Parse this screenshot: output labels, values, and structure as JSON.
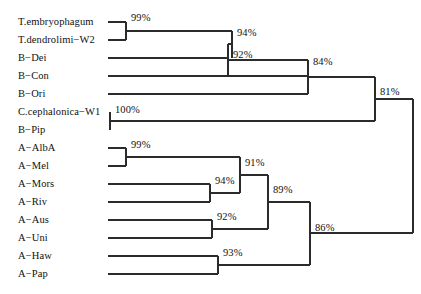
{
  "figure": {
    "type": "phylogenetic-tree",
    "title": "",
    "width": 421,
    "height": 294,
    "line_color": "#2b2b2b",
    "text_color": "#111111",
    "background": "#ffffff"
  },
  "taxa": [
    {
      "label": "T.embryophagum",
      "row": 0,
      "y": 22,
      "tip_x": 108
    },
    {
      "label": "T.dendrolimi−W2",
      "row": 1,
      "y": 40,
      "tip_x": 108
    },
    {
      "label": "B−Dei",
      "row": 2,
      "y": 58,
      "tip_x": 108
    },
    {
      "label": "B−Con",
      "row": 3,
      "y": 76,
      "tip_x": 108
    },
    {
      "label": "B−Ori",
      "row": 4,
      "y": 94,
      "tip_x": 108
    },
    {
      "label": "C.cephalonica−W1",
      "row": 5,
      "y": 112,
      "tip_x": 110
    },
    {
      "label": "B−Pip",
      "row": 6,
      "y": 130,
      "tip_x": 110
    },
    {
      "label": "A−AlbA",
      "row": 7,
      "y": 148,
      "tip_x": 108
    },
    {
      "label": "A−Mel",
      "row": 8,
      "y": 166,
      "tip_x": 108
    },
    {
      "label": "A−Mors",
      "row": 9,
      "y": 184,
      "tip_x": 108
    },
    {
      "label": "A−Riv",
      "row": 10,
      "y": 202,
      "tip_x": 108
    },
    {
      "label": "A−Aus",
      "row": 11,
      "y": 220,
      "tip_x": 108
    },
    {
      "label": "A−Uni",
      "row": 12,
      "y": 238,
      "tip_x": 108
    },
    {
      "label": "A−Haw",
      "row": 13,
      "y": 256,
      "tip_x": 108
    },
    {
      "label": "A−Pap",
      "row": 14,
      "y": 274,
      "tip_x": 108
    }
  ],
  "label_x": 18,
  "nodes": [
    {
      "id": "n99a",
      "support": "99%",
      "x": 126,
      "y_top": 22,
      "y_bottom": 40,
      "y_mid": 31,
      "label_x": 131,
      "label_y": 18
    },
    {
      "id": "n94a",
      "support": "94%",
      "x": 232,
      "y_top": 31,
      "y_bottom": 58,
      "y_mid": 44,
      "label_x": 237,
      "label_y": 33
    },
    {
      "id": "n92a",
      "support": "92%",
      "x": 228,
      "y_top": 44,
      "y_bottom": 76,
      "y_mid": 60,
      "label_x": 233,
      "label_y": 55
    },
    {
      "id": "n84",
      "support": "84%",
      "x": 308,
      "y_top": 60,
      "y_bottom": 94,
      "y_mid": 77,
      "label_x": 313,
      "label_y": 62
    },
    {
      "id": "n100",
      "support": "100%",
      "x": 110,
      "y_top": 112,
      "y_bottom": 130,
      "y_mid": 121,
      "label_x": 115,
      "label_y": 110
    },
    {
      "id": "n81",
      "support": "81%",
      "x": 375,
      "y_top": 77,
      "y_bottom": 121,
      "y_mid": 99,
      "label_x": 380,
      "label_y": 92
    },
    {
      "id": "n99b",
      "support": "99%",
      "x": 126,
      "y_top": 148,
      "y_bottom": 166,
      "y_mid": 157,
      "label_x": 131,
      "label_y": 145
    },
    {
      "id": "n94b",
      "support": "94%",
      "x": 210,
      "y_top": 184,
      "y_bottom": 202,
      "y_mid": 193,
      "label_x": 215,
      "label_y": 181
    },
    {
      "id": "n91",
      "support": "91%",
      "x": 240,
      "y_top": 157,
      "y_bottom": 193,
      "y_mid": 175,
      "label_x": 245,
      "label_y": 163
    },
    {
      "id": "n92b",
      "support": "92%",
      "x": 212,
      "y_top": 220,
      "y_bottom": 238,
      "y_mid": 229,
      "label_x": 217,
      "label_y": 217
    },
    {
      "id": "n89",
      "support": "89%",
      "x": 268,
      "y_top": 175,
      "y_bottom": 229,
      "y_mid": 202,
      "label_x": 273,
      "label_y": 190
    },
    {
      "id": "n93",
      "support": "93%",
      "x": 218,
      "y_top": 256,
      "y_bottom": 274,
      "y_mid": 265,
      "label_x": 223,
      "label_y": 253
    },
    {
      "id": "n86",
      "support": "86%",
      "x": 310,
      "y_top": 202,
      "y_bottom": 265,
      "y_mid": 233,
      "label_x": 315,
      "label_y": 228
    },
    {
      "id": "root",
      "support": "",
      "x": 413,
      "y_top": 99,
      "y_bottom": 233,
      "y_mid": 166,
      "label_x": 0,
      "label_y": 0
    }
  ],
  "edges": [
    {
      "name": "tip-T-embryophagum",
      "x1": 108,
      "y1": 22,
      "x2": 126,
      "y2": 22
    },
    {
      "name": "tip-T-dendrolimi-W2",
      "x1": 108,
      "y1": 40,
      "x2": 126,
      "y2": 40
    },
    {
      "name": "tip-B-Dei",
      "x1": 108,
      "y1": 58,
      "x2": 228,
      "y2": 58
    },
    {
      "name": "tip-B-Con",
      "x1": 108,
      "y1": 76,
      "x2": 308,
      "y2": 76
    },
    {
      "name": "tip-B-Ori",
      "x1": 108,
      "y1": 94,
      "x2": 308,
      "y2": 94
    },
    {
      "name": "tip-C-cephalonica-W1",
      "x1": 110,
      "y1": 112,
      "x2": 110,
      "y2": 112
    },
    {
      "name": "tip-B-Pip",
      "x1": 110,
      "y1": 130,
      "x2": 110,
      "y2": 130
    },
    {
      "name": "tip-A-AlbA",
      "x1": 108,
      "y1": 148,
      "x2": 126,
      "y2": 148
    },
    {
      "name": "tip-A-Mel",
      "x1": 108,
      "y1": 166,
      "x2": 126,
      "y2": 166
    },
    {
      "name": "tip-A-Mors",
      "x1": 108,
      "y1": 184,
      "x2": 210,
      "y2": 184
    },
    {
      "name": "tip-A-Riv",
      "x1": 108,
      "y1": 202,
      "x2": 210,
      "y2": 202
    },
    {
      "name": "tip-A-Aus",
      "x1": 108,
      "y1": 220,
      "x2": 212,
      "y2": 220
    },
    {
      "name": "tip-A-Uni",
      "x1": 108,
      "y1": 238,
      "x2": 212,
      "y2": 238
    },
    {
      "name": "tip-A-Haw",
      "x1": 108,
      "y1": 256,
      "x2": 218,
      "y2": 256
    },
    {
      "name": "tip-A-Pap",
      "x1": 108,
      "y1": 274,
      "x2": 218,
      "y2": 274
    },
    {
      "name": "stem-n99a",
      "x1": 126,
      "y1": 31,
      "x2": 232,
      "y2": 31
    },
    {
      "name": "stem-n94a",
      "x1": 232,
      "y1": 44,
      "x2": 228,
      "y2": 44
    },
    {
      "name": "stem-n92a",
      "x1": 228,
      "y1": 60,
      "x2": 308,
      "y2": 60
    },
    {
      "name": "stem-n84",
      "x1": 308,
      "y1": 77,
      "x2": 375,
      "y2": 77
    },
    {
      "name": "stem-n100",
      "x1": 110,
      "y1": 121,
      "x2": 375,
      "y2": 121
    },
    {
      "name": "stem-n81",
      "x1": 375,
      "y1": 99,
      "x2": 413,
      "y2": 99
    },
    {
      "name": "stem-n99b",
      "x1": 126,
      "y1": 157,
      "x2": 240,
      "y2": 157
    },
    {
      "name": "stem-n94b",
      "x1": 210,
      "y1": 193,
      "x2": 240,
      "y2": 193
    },
    {
      "name": "stem-n91",
      "x1": 240,
      "y1": 175,
      "x2": 268,
      "y2": 175
    },
    {
      "name": "stem-n92b",
      "x1": 212,
      "y1": 229,
      "x2": 268,
      "y2": 229
    },
    {
      "name": "stem-n89",
      "x1": 268,
      "y1": 202,
      "x2": 310,
      "y2": 202
    },
    {
      "name": "stem-n93",
      "x1": 218,
      "y1": 265,
      "x2": 310,
      "y2": 265
    },
    {
      "name": "stem-n86",
      "x1": 310,
      "y1": 233,
      "x2": 413,
      "y2": 233
    }
  ]
}
